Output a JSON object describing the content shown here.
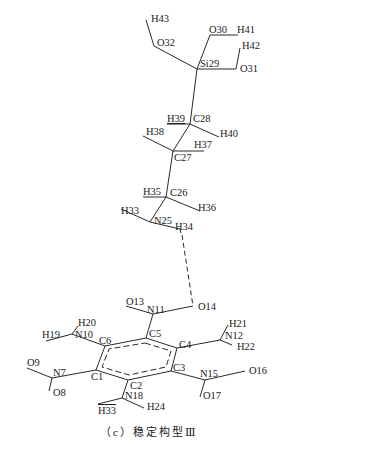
{
  "figure": {
    "caption": "（c）稳定构型Ⅲ",
    "title_partial": "",
    "background": "#ffffff",
    "line_color": "#2a2a2a"
  },
  "atoms": {
    "Si29": "Si29",
    "O30": "O30",
    "O31": "O31",
    "O32": "O32",
    "H41": "H41",
    "H42": "H42",
    "H43": "H43",
    "C28": "C28",
    "H39": "H39",
    "H40": "H40",
    "C27": "C27",
    "H37": "H37",
    "H38": "H38",
    "C26": "C26",
    "H35": "H35",
    "H36": "H36",
    "N25": "N25",
    "H33a": "H33",
    "H34": "H34",
    "O14": "O14",
    "N11": "N11",
    "O13": "O13",
    "C1": "C1",
    "C2": "C2",
    "C3": "C3",
    "C4": "C4",
    "C5": "C5",
    "C6": "C6",
    "N10": "N10",
    "H19": "H19",
    "H20": "H20",
    "N7": "N7",
    "O8": "O8",
    "O9": "O9",
    "N18": "N18",
    "H33b": "H33",
    "H24": "H24",
    "N12": "N12",
    "H21": "H21",
    "H22": "H22",
    "N15": "N15",
    "O16": "O16",
    "O17": "O17"
  },
  "interactions": {
    "hydrogen_bond": "H34 ··· O14 (dashed)"
  }
}
